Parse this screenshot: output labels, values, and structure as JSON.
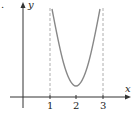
{
  "figure": {
    "bullet": ".",
    "axes": {
      "x_label": "x",
      "y_label": "y",
      "x_ticks": [
        "1",
        "2",
        "3"
      ]
    },
    "asymptotes": [
      1,
      3
    ],
    "curve": {
      "shape": "U-shaped curve between vertical asymptotes x=1 and x=3 with minimum at x=2",
      "min_x": 2
    },
    "colors": {
      "axis": "#333333",
      "curve": "#888888",
      "dashed": "#aaaaaa"
    }
  }
}
